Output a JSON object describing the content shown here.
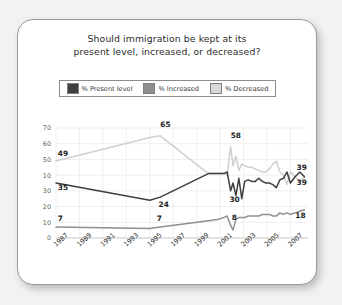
{
  "card": {
    "title_line1": "Should immigration be kept at its",
    "title_line2": "present level, increased, or decreased?"
  },
  "legend": {
    "items": [
      {
        "label": "% Present level",
        "color": "#3f3f3f"
      },
      {
        "label": "% Increased",
        "color": "#8f8f8f"
      },
      {
        "label": "% Decreased",
        "color": "#d8d8d8"
      }
    ]
  },
  "chart_data": {
    "type": "line",
    "title": "Should immigration be kept at its present level, increased, or decreased?",
    "xlabel": "",
    "ylabel": "",
    "ylim": [
      0,
      70
    ],
    "grid": true,
    "legend_position": "top",
    "y_ticks": [
      "70",
      "60",
      "50",
      "10",
      "30",
      "20",
      "10",
      "0"
    ],
    "y_tick_values": [
      70,
      60,
      50,
      40,
      30,
      20,
      10,
      0
    ],
    "x_tick_labels": [
      "1987",
      "1989",
      "1991",
      "1993",
      "1995",
      "1997",
      "1999",
      "2001",
      "2003",
      "2005",
      "2007"
    ],
    "x_tick_values": [
      1987,
      1989,
      1991,
      1993,
      1995,
      1997,
      1999,
      2001,
      2003,
      2005,
      2007
    ],
    "xlim": [
      1987,
      2008.5
    ],
    "series": [
      {
        "name": "% Decreased",
        "color": "#d0d0d0",
        "x": [
          1987,
          1995,
          1995.9,
          2000,
          2000.9,
          2001.3,
          2001.6,
          2001.9,
          2002.1,
          2002.35,
          2002.6,
          2002.85,
          2003.1,
          2003.4,
          2003.7,
          2004,
          2004.3,
          2004.6,
          2004.9,
          2005.2,
          2005.5,
          2005.8,
          2006.1,
          2006.4,
          2006.7,
          2007,
          2007.4,
          2007.8,
          2008.2
        ],
        "y": [
          49,
          64,
          65,
          41,
          41,
          41,
          40,
          58,
          46,
          52,
          43,
          47,
          46,
          45,
          45,
          44,
          43,
          42,
          42,
          44,
          47,
          49,
          42,
          40,
          34,
          42,
          39,
          36,
          39
        ]
      },
      {
        "name": "% Present level",
        "color": "#3f3f3f",
        "x": [
          1987,
          1995,
          1995.9,
          2000,
          2000.9,
          2001.3,
          2001.6,
          2001.9,
          2002.1,
          2002.35,
          2002.6,
          2002.85,
          2003.1,
          2003.4,
          2003.7,
          2004,
          2004.3,
          2004.6,
          2004.9,
          2005.2,
          2005.5,
          2005.8,
          2006.1,
          2006.4,
          2006.7,
          2007,
          2007.4,
          2007.8,
          2008.2
        ],
        "y": [
          35,
          24,
          26,
          41,
          41,
          41,
          42,
          30,
          35,
          27,
          38,
          25,
          36,
          37,
          36,
          36,
          38,
          36,
          35,
          35,
          34,
          32,
          37,
          38,
          42,
          35,
          39,
          42,
          39
        ]
      },
      {
        "name": "% Increased",
        "color": "#8f8f8f",
        "x": [
          1987,
          1995,
          1995.9,
          2000,
          2000.9,
          2001.3,
          2001.6,
          2001.9,
          2002.1,
          2002.35,
          2002.6,
          2002.85,
          2003.1,
          2003.4,
          2003.7,
          2004,
          2004.3,
          2004.6,
          2004.9,
          2005.2,
          2005.5,
          2005.8,
          2006.1,
          2006.4,
          2006.7,
          2007,
          2007.4,
          2007.8,
          2008.2
        ],
        "y": [
          7,
          6,
          7,
          11,
          12,
          13,
          14,
          8,
          5,
          12,
          13,
          13,
          13,
          14,
          14,
          14,
          14,
          15,
          15,
          15,
          14,
          14,
          16,
          15,
          16,
          15,
          16,
          17,
          18
        ]
      }
    ],
    "annotations": [
      {
        "text": "49",
        "x": 1987.15,
        "y": 52.5,
        "series": "% Decreased"
      },
      {
        "text": "65",
        "x": 1995.9,
        "y": 70.5,
        "series": "% Decreased"
      },
      {
        "text": "58",
        "x": 2001.9,
        "y": 63.5,
        "series": "% Decreased"
      },
      {
        "text": "39",
        "x": 2008.4,
        "y": 43.5,
        "series": "% Decreased"
      },
      {
        "text": "35",
        "x": 1987.15,
        "y": 30.5,
        "series": "% Present level"
      },
      {
        "text": "24",
        "x": 1995.75,
        "y": 19.5,
        "series": "% Present level"
      },
      {
        "text": "30",
        "x": 2001.8,
        "y": 23.0,
        "series": "% Present level"
      },
      {
        "text": "39",
        "x": 2008.4,
        "y": 33.5,
        "series": "% Present level"
      },
      {
        "text": "7",
        "x": 1987.15,
        "y": 11.0,
        "series": "% Increased"
      },
      {
        "text": "7",
        "x": 1995.6,
        "y": 11.0,
        "series": "% Increased"
      },
      {
        "text": "8",
        "x": 2002.0,
        "y": 11.5,
        "series": "% Increased"
      },
      {
        "text": "18",
        "x": 2008.3,
        "y": 13.0,
        "series": "% Increased"
      }
    ]
  }
}
